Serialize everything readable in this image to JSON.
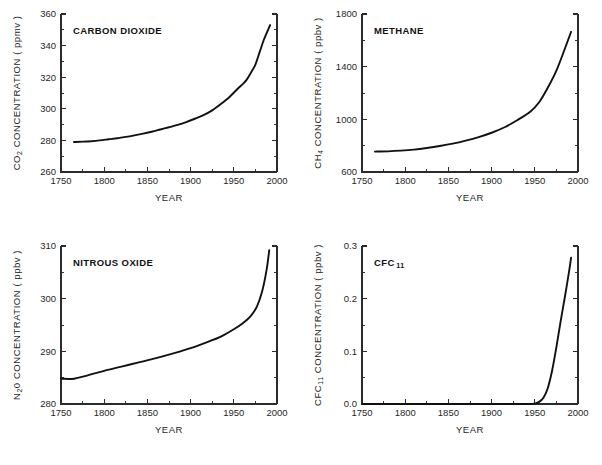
{
  "figure": {
    "name": "atmospheric-greenhouse-gas-concentrations",
    "background": "#ffffff",
    "curve_color": "#111111",
    "axis_color": "#2b2b2b",
    "panel_count": 4
  },
  "chart_data": [
    {
      "id": "co2",
      "type": "line",
      "title": "CARBON DIOXIDE",
      "title_prefix": "CO",
      "title_sub": "2",
      "title_suffix": "",
      "ylabel_main": "CONCENTRATION  ( ppmv )",
      "ylabel_species": "CO",
      "ylabel_sub": "2",
      "xlabel": "YEAR",
      "xlim": [
        1750,
        2000
      ],
      "ylim": [
        260,
        360
      ],
      "xticks": [
        1750,
        1800,
        1850,
        1900,
        1950,
        2000
      ],
      "xticklabels": [
        "1750",
        "1800",
        "1850",
        "1900",
        "1950",
        "2000"
      ],
      "xminorticks": [
        1775,
        1825,
        1875,
        1925,
        1975
      ],
      "yticks": [
        260,
        280,
        300,
        320,
        340,
        360
      ],
      "yticklabels": [
        "260",
        "280",
        "300",
        "320",
        "340",
        "360"
      ],
      "yminorticks": [
        270,
        290,
        310,
        330,
        350
      ],
      "grid": false,
      "legend": "none",
      "x": [
        1765,
        1775,
        1785,
        1795,
        1805,
        1815,
        1825,
        1835,
        1845,
        1855,
        1865,
        1875,
        1885,
        1895,
        1905,
        1915,
        1925,
        1935,
        1945,
        1955,
        1960,
        1965,
        1970,
        1975,
        1980,
        1985,
        1992
      ],
      "y": [
        279.0,
        279.2,
        279.5,
        280.0,
        280.7,
        281.4,
        282.2,
        283.2,
        284.3,
        285.5,
        286.9,
        288.3,
        289.8,
        291.6,
        293.7,
        296.0,
        299.0,
        303.0,
        307.5,
        313.0,
        315.5,
        318.5,
        323.0,
        328.0,
        336.0,
        344.0,
        353.0
      ]
    },
    {
      "id": "ch4",
      "type": "line",
      "title": "METHANE",
      "ylabel_main": "CONCENTRATION  ( ppbv )",
      "ylabel_species": "CH",
      "ylabel_sub": "4",
      "xlabel": "YEAR",
      "xlim": [
        1750,
        2000
      ],
      "ylim": [
        600,
        1800
      ],
      "xticks": [
        1750,
        1800,
        1850,
        1900,
        1950,
        2000
      ],
      "xticklabels": [
        "1750",
        "1800",
        "1850",
        "1900",
        "1950",
        "2000"
      ],
      "xminorticks": [
        1775,
        1825,
        1875,
        1925,
        1975
      ],
      "yticks": [
        600,
        1000,
        1400,
        1800
      ],
      "yticklabels": [
        "600",
        "1000",
        "1400",
        "1800"
      ],
      "yminorticks": [
        800,
        1200,
        1600
      ],
      "grid": false,
      "legend": "none",
      "x": [
        1765,
        1780,
        1795,
        1810,
        1825,
        1840,
        1855,
        1870,
        1885,
        1900,
        1915,
        1930,
        1945,
        1955,
        1965,
        1975,
        1985,
        1992
      ],
      "y": [
        755,
        757,
        762,
        770,
        782,
        797,
        815,
        838,
        865,
        898,
        940,
        995,
        1060,
        1130,
        1240,
        1370,
        1540,
        1665
      ]
    },
    {
      "id": "n2o",
      "type": "line",
      "title": "NITROUS OXIDE",
      "ylabel_main": "CONCENTRATION  ( ppbv )",
      "ylabel_species": "N",
      "ylabel_sub": "2",
      "ylabel_species_tail": "0",
      "xlabel": "YEAR",
      "xlim": [
        1750,
        2000
      ],
      "ylim": [
        280,
        310
      ],
      "xticks": [
        1750,
        1800,
        1850,
        1900,
        1950,
        2000
      ],
      "xticklabels": [
        "1750",
        "1800",
        "1850",
        "1900",
        "1950",
        "2000"
      ],
      "xminorticks": [
        1775,
        1825,
        1875,
        1925,
        1975
      ],
      "yticks": [
        280,
        290,
        300,
        310
      ],
      "yticklabels": [
        "280",
        "290",
        "300",
        "310"
      ],
      "yminorticks": [
        285,
        295,
        305
      ],
      "grid": false,
      "legend": "none",
      "x": [
        1750,
        1765,
        1780,
        1800,
        1820,
        1840,
        1860,
        1880,
        1900,
        1920,
        1935,
        1950,
        1960,
        1970,
        1977,
        1983,
        1988,
        1991
      ],
      "y": [
        284.8,
        284.8,
        285.4,
        286.3,
        287.1,
        287.9,
        288.7,
        289.6,
        290.6,
        291.8,
        292.8,
        294.2,
        295.3,
        296.8,
        298.6,
        301.5,
        305.5,
        309.2
      ]
    },
    {
      "id": "cfc11",
      "type": "line",
      "title_prefix": "CFC",
      "title_sub": "11",
      "ylabel_main": "CONCENTRATION  ( ppbv )",
      "ylabel_species": "CFC",
      "ylabel_sub": "11",
      "xlabel": "YEAR",
      "xlim": [
        1750,
        2000
      ],
      "ylim": [
        0.0,
        0.3
      ],
      "xticks": [
        1750,
        1800,
        1850,
        1900,
        1950,
        2000
      ],
      "xticklabels": [
        "1750",
        "1800",
        "1850",
        "1900",
        "1950",
        "2000"
      ],
      "xminorticks": [
        1775,
        1825,
        1875,
        1925,
        1975
      ],
      "yticks": [
        0.0,
        0.1,
        0.2,
        0.3
      ],
      "yticklabels": [
        "0.0",
        "0.1",
        "0.2",
        "0.3"
      ],
      "yminorticks": [
        0.05,
        0.15,
        0.25
      ],
      "grid": false,
      "legend": "none",
      "x": [
        1750,
        1850,
        1930,
        1945,
        1950,
        1955,
        1960,
        1965,
        1970,
        1975,
        1980,
        1985,
        1990,
        1992
      ],
      "y": [
        0.0,
        0.0,
        0.0,
        0.0,
        0.001,
        0.004,
        0.012,
        0.03,
        0.063,
        0.108,
        0.158,
        0.205,
        0.255,
        0.278
      ]
    }
  ]
}
